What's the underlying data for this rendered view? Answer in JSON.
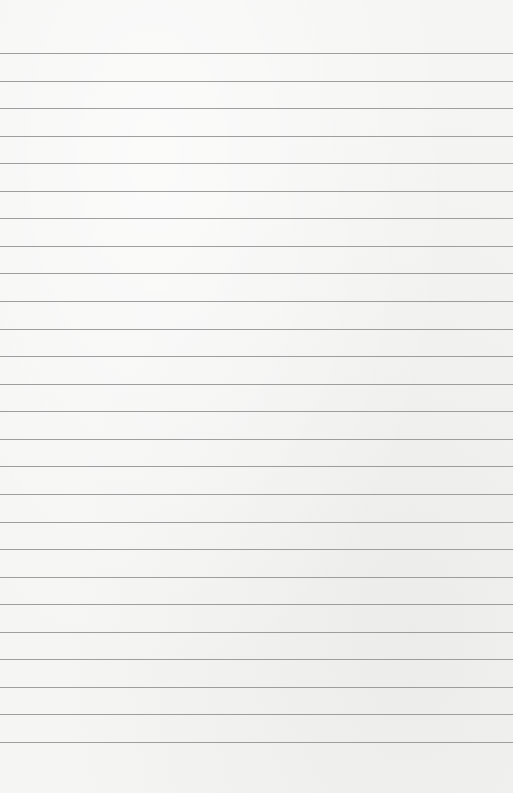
{
  "page": {
    "type": "lined-paper",
    "background_color": "#f5f5f4",
    "line_color": "#8e8e8e",
    "line_count": 26,
    "first_line_y": 53,
    "line_spacing": 27.56
  }
}
